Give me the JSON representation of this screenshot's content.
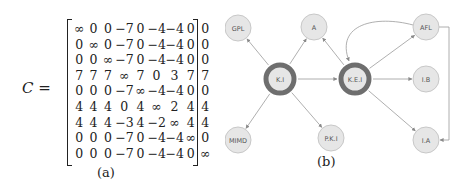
{
  "panel_a": {
    "matrix_name": "C",
    "equals": " =",
    "caption": "(a)",
    "rows": [
      [
        "∞",
        "0",
        "0",
        "−7",
        "0",
        "−4",
        "−4",
        "0",
        "0"
      ],
      [
        "0",
        "∞",
        "0",
        "−7",
        "0",
        "−4",
        "−4",
        "0",
        "0"
      ],
      [
        "0",
        "0",
        "∞",
        "−7",
        "0",
        "−4",
        "−4",
        "0",
        "0"
      ],
      [
        "7",
        "7",
        "7",
        "∞",
        "7",
        "0",
        "3",
        "7",
        "7"
      ],
      [
        "0",
        "0",
        "0",
        "−7",
        "∞",
        "−4",
        "−4",
        "0",
        "0"
      ],
      [
        "4",
        "4",
        "4",
        "0",
        "4",
        "∞",
        "2",
        "4",
        "4"
      ],
      [
        "4",
        "4",
        "4",
        "−3",
        "4",
        "−2",
        "∞",
        "4",
        "4"
      ],
      [
        "0",
        "0",
        "0",
        "−7",
        "0",
        "−4",
        "−4",
        "∞",
        "0"
      ],
      [
        "0",
        "0",
        "0",
        "−7",
        "0",
        "−4",
        "−4",
        "0",
        "∞"
      ]
    ]
  },
  "panel_b": {
    "caption": "(b)",
    "colors": {
      "node_fill": "#e6e6e6",
      "node_stroke": "#c8c8c8",
      "hub_ring": "#6e6e6e",
      "edge": "#9a9a9a",
      "label": "#555555"
    },
    "nodes": [
      {
        "id": "GPL",
        "label": "GPL",
        "cx": 13,
        "cy": 28,
        "hub": false
      },
      {
        "id": "A",
        "label": "A",
        "cx": 89,
        "cy": 27,
        "hub": false
      },
      {
        "id": "KI",
        "label": "K.I",
        "cx": 55,
        "cy": 79,
        "hub": true
      },
      {
        "id": "KEI",
        "label": "K.E.I",
        "cx": 130,
        "cy": 79,
        "hub": true
      },
      {
        "id": "AFL",
        "label": "AFL",
        "cx": 201,
        "cy": 27,
        "hub": false
      },
      {
        "id": "IB",
        "label": "I.B",
        "cx": 201,
        "cy": 79,
        "hub": false
      },
      {
        "id": "IA",
        "label": "I.A",
        "cx": 201,
        "cy": 140,
        "hub": false
      },
      {
        "id": "MIMD",
        "label": "MIMD",
        "cx": 13,
        "cy": 140,
        "hub": false
      },
      {
        "id": "PKI",
        "label": "P.K.I",
        "cx": 106,
        "cy": 138,
        "hub": false
      }
    ],
    "edges": [
      [
        "KI",
        "GPL"
      ],
      [
        "KI",
        "A"
      ],
      [
        "KI",
        "KEI"
      ],
      [
        "KI",
        "MIMD"
      ],
      [
        "KI",
        "PKI"
      ],
      [
        "KEI",
        "A"
      ],
      [
        "KEI",
        "AFL"
      ],
      [
        "KEI",
        "IB"
      ],
      [
        "KEI",
        "IA"
      ],
      [
        "AFL",
        "KEI",
        "curved"
      ],
      [
        "AFL",
        "IA",
        "elbow"
      ]
    ]
  }
}
